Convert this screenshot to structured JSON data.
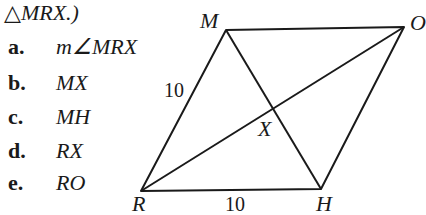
{
  "header": {
    "text": "△MRX.)"
  },
  "items": [
    {
      "label": "a.",
      "value": "m∠MRX"
    },
    {
      "label": "b.",
      "value": "MX"
    },
    {
      "label": "c.",
      "value": "MH"
    },
    {
      "label": "d.",
      "value": "RX"
    },
    {
      "label": "e.",
      "value": "RO"
    }
  ],
  "figure": {
    "vertices": {
      "M": "M",
      "O": "O",
      "X": "X",
      "R": "R",
      "H": "H"
    },
    "side_labels": {
      "MR": "10",
      "RH": "10"
    }
  }
}
